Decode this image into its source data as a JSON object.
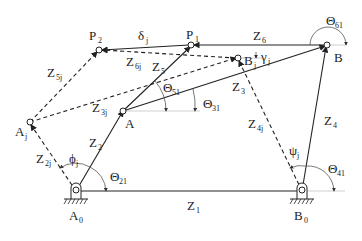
{
  "diagram": {
    "points": {
      "A0": "A0",
      "B0": "B0",
      "A": "A",
      "B": "B",
      "P1": "P1",
      "P2": "P2",
      "Aj": "Aj",
      "Bj": "Bj"
    },
    "labels": {
      "A0": {
        "main": "A",
        "sub": "0"
      },
      "B0": {
        "main": "B",
        "sub": "0"
      },
      "A": {
        "main": "A",
        "sub": ""
      },
      "B": {
        "main": "B",
        "sub": ""
      },
      "P1": {
        "main": "P",
        "sub": "1"
      },
      "P2": {
        "main": "P",
        "sub": "2"
      },
      "Aj": {
        "main": "A",
        "sub": "j"
      },
      "Bj": {
        "main": "B",
        "sub": "j"
      },
      "Z1": {
        "main": "Z",
        "sub": "1"
      },
      "Z2": {
        "main": "Z",
        "sub": "2"
      },
      "Z3": {
        "main": "Z",
        "sub": "3"
      },
      "Z4": {
        "main": "Z",
        "sub": "4"
      },
      "Z5": {
        "main": "Z",
        "sub": "5"
      },
      "Z6": {
        "main": "Z",
        "sub": "6"
      },
      "Z2j": {
        "main": "Z",
        "sub": "2j"
      },
      "Z3j": {
        "main": "Z",
        "sub": "3j"
      },
      "Z4j": {
        "main": "Z",
        "sub": "4j"
      },
      "Z5j": {
        "main": "Z",
        "sub": "5j"
      },
      "Z6j": {
        "main": "Z",
        "sub": "6j"
      },
      "Theta21": {
        "main": "Θ",
        "sub": "21"
      },
      "Theta31": {
        "main": "Θ",
        "sub": "31"
      },
      "Theta41": {
        "main": "Θ",
        "sub": "41"
      },
      "Theta51": {
        "main": "Θ",
        "sub": "51"
      },
      "Theta61": {
        "main": "Θ",
        "sub": "61"
      },
      "phij": {
        "main": "ϕ",
        "sub": "j"
      },
      "psij": {
        "main": "ψ",
        "sub": "j"
      },
      "gammaj": {
        "main": "γ",
        "sub": "j"
      },
      "deltaj": {
        "main": "δ",
        "sub": "j"
      }
    },
    "links": {
      "solid": [
        "Z1: A0-B0",
        "Z2: A0-A",
        "Z3: A-B",
        "Z4: B0-B",
        "Z5: A-P1",
        "Z6: B-P1",
        "delta: P1-P2"
      ],
      "dashed": [
        "Z2j: A0-Aj",
        "Z3j: Aj-Bj",
        "Z4j: B0-Bj",
        "Z5j: Aj-P2",
        "Z6j: Bj-P2"
      ]
    }
  }
}
